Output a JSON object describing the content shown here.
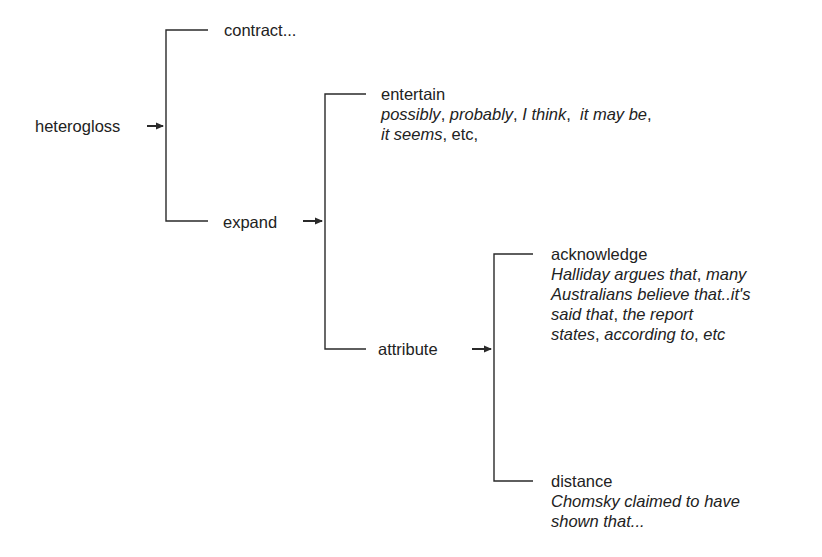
{
  "diagram": {
    "type": "system-network",
    "line_color": "#2a2a2a",
    "text_color": "#222222",
    "root": {
      "label": "heterogloss"
    },
    "level1": {
      "contract": {
        "label": "contract..."
      },
      "expand": {
        "label": "expand"
      }
    },
    "level2": {
      "entertain": {
        "label": "entertain",
        "example_lines": [
          [
            {
              "text": "possibly",
              "italic": true
            },
            {
              "text": ", ",
              "italic": false
            },
            {
              "text": "probably",
              "italic": true
            },
            {
              "text": ", ",
              "italic": false
            },
            {
              "text": "I think",
              "italic": true
            },
            {
              "text": ",  ",
              "italic": false
            },
            {
              "text": "it may be",
              "italic": true
            },
            {
              "text": ",",
              "italic": false
            }
          ],
          [
            {
              "text": "it seems",
              "italic": true
            },
            {
              "text": ", etc,",
              "italic": false
            }
          ]
        ]
      },
      "attribute": {
        "label": "attribute"
      }
    },
    "level3": {
      "acknowledge": {
        "label": "acknowledge",
        "example_lines": [
          [
            {
              "text": "Halliday argues that",
              "italic": true
            },
            {
              "text": ", ",
              "italic": false
            },
            {
              "text": "many",
              "italic": true
            }
          ],
          [
            {
              "text": "Australians believe that..it's",
              "italic": true
            }
          ],
          [
            {
              "text": "said that",
              "italic": true
            },
            {
              "text": ", ",
              "italic": false
            },
            {
              "text": "the report",
              "italic": true
            }
          ],
          [
            {
              "text": "states",
              "italic": true
            },
            {
              "text": ", ",
              "italic": false
            },
            {
              "text": "according to",
              "italic": true
            },
            {
              "text": ", ",
              "italic": false
            },
            {
              "text": "etc",
              "italic": true
            }
          ]
        ]
      },
      "distance": {
        "label": "distance",
        "example_lines": [
          [
            {
              "text": "Chomsky claimed to have",
              "italic": true
            }
          ],
          [
            {
              "text": "shown that...",
              "italic": true
            }
          ]
        ]
      }
    },
    "arrows": [
      {
        "from": "heterogloss",
        "to": "system-1"
      },
      {
        "from": "expand",
        "to": "system-2"
      },
      {
        "from": "attribute",
        "to": "system-3"
      }
    ]
  }
}
